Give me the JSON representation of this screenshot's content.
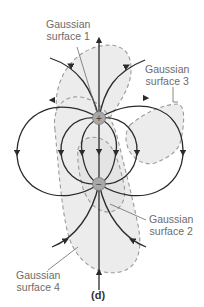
{
  "diagram": {
    "caption": "(d)",
    "charges": [
      {
        "sign": "+",
        "symbol": "+",
        "x": 99,
        "y": 118
      },
      {
        "sign": "-",
        "symbol": "−",
        "x": 99,
        "y": 184
      }
    ],
    "surfaces": [
      {
        "id": 1,
        "line1": "Gaussian",
        "line2": "surface 1"
      },
      {
        "id": 2,
        "line1": "Gaussian",
        "line2": "surface 2"
      },
      {
        "id": 3,
        "line1": "Gaussian",
        "line2": "surface 3"
      },
      {
        "id": 4,
        "line1": "Gaussian",
        "line2": "surface 4"
      }
    ],
    "colors": {
      "field_line": "#2b2b2b",
      "surface_dash": "#9a9a9a",
      "surface_fill": "#ececec",
      "charge_fill": "#a8a8a8",
      "label_text": "#6b6b6b"
    }
  }
}
